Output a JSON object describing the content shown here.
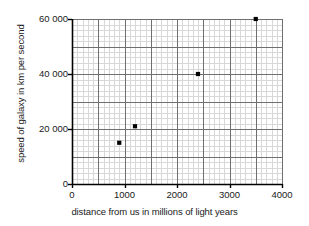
{
  "chart_data": {
    "type": "scatter",
    "title": "",
    "xlabel": "distance from us in millions of light years",
    "ylabel": "speed of galaxy in km per second",
    "xlim": [
      0,
      4000
    ],
    "ylim": [
      0,
      60000
    ],
    "grid": true,
    "legend": "none",
    "x_ticks": [
      0,
      1000,
      2000,
      3000,
      4000
    ],
    "x_tick_labels": [
      "0",
      "1000",
      "2000",
      "3000",
      "4000"
    ],
    "y_ticks": [
      0,
      20000,
      40000,
      60000
    ],
    "y_tick_labels": [
      "0",
      "20 000",
      "40 000",
      "60 000"
    ],
    "x_major_grid_step": 500,
    "x_minor_grid_step": 100,
    "y_major_grid_step": 10000,
    "y_minor_grid_step": 2000,
    "marker": "filled-square",
    "marker_color": "#000000",
    "grid_major_color": "#6f6f6f",
    "grid_minor_color": "#d8d8d8",
    "axis_color": "#000000",
    "points": [
      {
        "x": 900,
        "y": 15000
      },
      {
        "x": 1200,
        "y": 21000
      },
      {
        "x": 2400,
        "y": 40000
      },
      {
        "x": 3500,
        "y": 60000
      }
    ],
    "x": [
      900,
      1200,
      2400,
      3500
    ],
    "values": [
      15000,
      21000,
      40000,
      60000
    ]
  }
}
